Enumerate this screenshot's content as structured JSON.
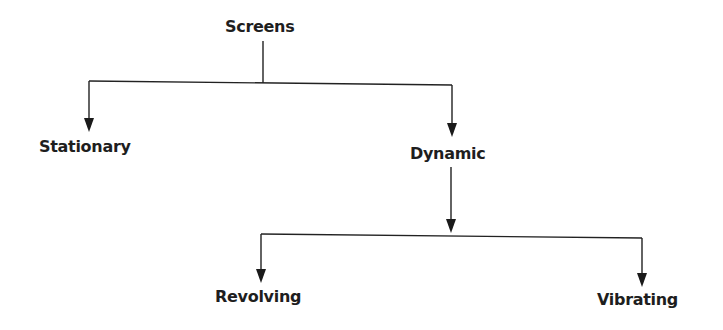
{
  "diagram": {
    "type": "tree",
    "root": {
      "label": "Screens",
      "children": [
        {
          "label": "Stationary",
          "children": []
        },
        {
          "label": "Dynamic",
          "children": [
            {
              "label": "Revolving",
              "children": []
            },
            {
              "label": "Vibrating",
              "children": []
            }
          ]
        }
      ]
    },
    "nodes": {
      "screens": "Screens",
      "stationary": "Stationary",
      "dynamic": "Dynamic",
      "revolving": "Revolving",
      "vibrating": "Vibrating"
    },
    "edges": [
      {
        "from": "Screens",
        "to": "Stationary"
      },
      {
        "from": "Screens",
        "to": "Dynamic"
      },
      {
        "from": "Dynamic",
        "to": "Revolving"
      },
      {
        "from": "Dynamic",
        "to": "Vibrating"
      }
    ],
    "colors": {
      "line": "#222222",
      "text": "#1e1e1e",
      "background": "#ffffff"
    }
  }
}
